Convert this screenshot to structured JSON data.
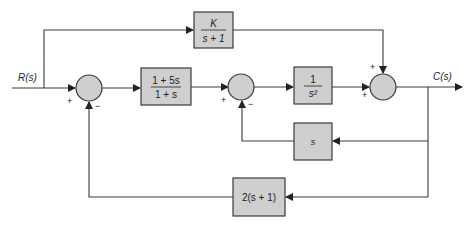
{
  "diagram": {
    "type": "block_diagram",
    "input": {
      "label": "R(s)"
    },
    "output": {
      "label": "C(s)"
    },
    "blocks": [
      {
        "id": "feedforward",
        "num": "K",
        "den": "s + 1"
      },
      {
        "id": "controller",
        "num": "1 + 5s",
        "den": "1 + s"
      },
      {
        "id": "plant",
        "num": "1",
        "den": "s²"
      },
      {
        "id": "inner_feedback",
        "label": "s"
      },
      {
        "id": "outer_feedback",
        "label": "2(s + 1)"
      }
    ],
    "summing_junctions": [
      {
        "id": "sum1",
        "signs": [
          "+",
          "−"
        ]
      },
      {
        "id": "sum2",
        "signs": [
          "+",
          "−"
        ]
      },
      {
        "id": "sum3",
        "signs": [
          "+",
          "+"
        ]
      }
    ]
  }
}
